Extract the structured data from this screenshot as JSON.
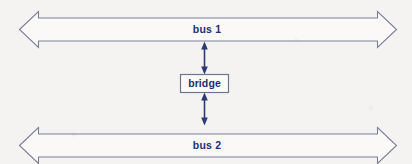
{
  "diagram": {
    "background_color": "#f4f3f1",
    "outline_color": "#7b8098",
    "label_color": "#20306d",
    "connector_color": "#2b3a75",
    "buses": [
      {
        "id": "bus-1",
        "label": "bus 1",
        "icon": "double-headed-arrow-horizontal",
        "position": "top"
      },
      {
        "id": "bus-2",
        "label": "bus 2",
        "icon": "double-headed-arrow-horizontal",
        "position": "bottom"
      }
    ],
    "node": {
      "id": "bridge",
      "label": "bridge",
      "shape": "rectangle"
    },
    "connectors": [
      {
        "id": "bridge-to-bus-1",
        "from": "bridge",
        "to": "bus 1",
        "icon": "double-headed-arrow-vertical",
        "direction": "bidirectional"
      },
      {
        "id": "bridge-to-bus-2",
        "from": "bridge",
        "to": "bus 2",
        "icon": "double-headed-arrow-vertical",
        "direction": "bidirectional"
      }
    ]
  }
}
